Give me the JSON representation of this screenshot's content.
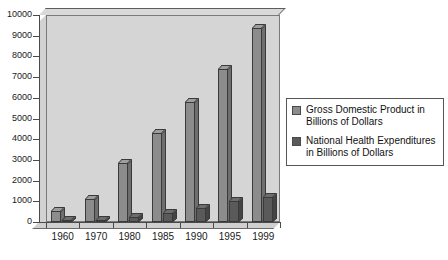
{
  "chart_data": {
    "type": "bar",
    "title": "",
    "xlabel": "",
    "ylabel": "",
    "ylim": [
      0,
      10000
    ],
    "ytick_step": 1000,
    "grid": false,
    "legend_position": "right",
    "categories": [
      "1960",
      "1970",
      "1980",
      "1985",
      "1990",
      "1995",
      "1999"
    ],
    "ytick_labels": [
      "10000",
      "9000",
      "8000",
      "7000",
      "6000",
      "5000",
      "4000",
      "3000",
      "2000",
      "1000",
      "0"
    ],
    "series": [
      {
        "name": "Gross Domestic Product in Billions of Dollars",
        "legend_line1": "Gross Domestic Product in",
        "legend_line2": "Billions of Dollars",
        "color": "#8c8c8c",
        "values": [
          530,
          1110,
          2860,
          4300,
          5800,
          7400,
          9350
        ]
      },
      {
        "name": "National Health Expenditures in Billions of Dollars",
        "legend_line1": "National Health Expenditures",
        "legend_line2": "in Billions of Dollars",
        "color": "#5a5a5a",
        "values": [
          30,
          80,
          250,
          430,
          700,
          1000,
          1220
        ]
      }
    ]
  }
}
